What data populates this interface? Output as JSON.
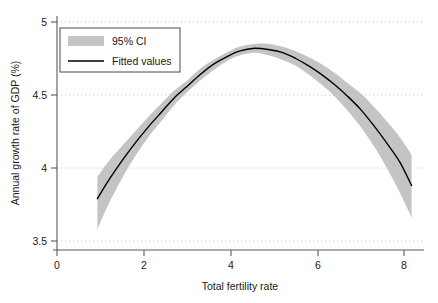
{
  "chart_data": {
    "type": "line",
    "title": "",
    "subtitle": "",
    "xlabel": "Total fertility rate",
    "ylabel": "Annual growth rate of GDP (%)",
    "xlim": [
      0,
      8.6
    ],
    "ylim": [
      3.37,
      5.0
    ],
    "xticks": [
      0,
      2,
      4,
      6,
      8
    ],
    "xticklabels": [
      "0",
      "2",
      "4",
      "6",
      "8"
    ],
    "yticks": [
      3.5,
      4,
      4.5,
      5
    ],
    "yticklabels": [
      "3.5",
      "4",
      "4.5",
      "5"
    ],
    "grid": "horizontal-dotted",
    "legend_position": "top-left",
    "legend": [
      {
        "key": "ci_band",
        "label": "95% CI",
        "marker": "filled-rect",
        "color": "#c4c4c4"
      },
      {
        "key": "fitted",
        "label": "Fitted values",
        "marker": "line",
        "color": "#000000"
      }
    ],
    "series": [
      {
        "name": "Fitted values",
        "type": "line",
        "color": "#000000",
        "x": [
          0.93,
          1.2,
          1.5,
          1.8,
          2.1,
          2.4,
          2.7,
          3.0,
          3.3,
          3.6,
          3.9,
          4.2,
          4.55,
          4.9,
          5.2,
          5.5,
          5.8,
          6.1,
          6.4,
          6.7,
          7.0,
          7.3,
          7.6,
          7.9,
          8.17
        ],
        "values": [
          3.79,
          3.92,
          4.05,
          4.17,
          4.28,
          4.38,
          4.48,
          4.56,
          4.64,
          4.71,
          4.76,
          4.8,
          4.82,
          4.81,
          4.79,
          4.75,
          4.7,
          4.64,
          4.57,
          4.49,
          4.4,
          4.29,
          4.17,
          4.04,
          3.88
        ]
      },
      {
        "name": "95% CI upper",
        "type": "band-upper",
        "color": "#c4c4c4",
        "x": [
          0.93,
          1.2,
          1.5,
          1.8,
          2.1,
          2.4,
          2.7,
          3.0,
          3.3,
          3.6,
          3.9,
          4.2,
          4.55,
          4.9,
          5.2,
          5.5,
          5.8,
          6.1,
          6.4,
          6.7,
          7.0,
          7.3,
          7.6,
          7.9,
          8.17
        ],
        "values": [
          3.94,
          4.05,
          4.15,
          4.25,
          4.35,
          4.44,
          4.53,
          4.6,
          4.68,
          4.74,
          4.79,
          4.83,
          4.85,
          4.85,
          4.83,
          4.8,
          4.76,
          4.71,
          4.65,
          4.58,
          4.51,
          4.42,
          4.32,
          4.21,
          4.09
        ]
      },
      {
        "name": "95% CI lower",
        "type": "band-lower",
        "color": "#c4c4c4",
        "x": [
          0.93,
          1.2,
          1.5,
          1.8,
          2.1,
          2.4,
          2.7,
          3.0,
          3.3,
          3.6,
          3.9,
          4.2,
          4.55,
          4.9,
          5.2,
          5.5,
          5.8,
          6.1,
          6.4,
          6.7,
          7.0,
          7.3,
          7.6,
          7.9,
          8.17
        ],
        "values": [
          3.58,
          3.76,
          3.93,
          4.08,
          4.21,
          4.32,
          4.43,
          4.52,
          4.6,
          4.67,
          4.73,
          4.77,
          4.79,
          4.77,
          4.74,
          4.7,
          4.64,
          4.57,
          4.49,
          4.39,
          4.28,
          4.15,
          4.0,
          3.83,
          3.66
        ]
      }
    ]
  },
  "style": {
    "band_color": "#c4c4c4",
    "line_color": "#000000",
    "grid_color": "#b9b9cc",
    "axis_color": "#5a5a5a",
    "text_color": "#1a1a1a",
    "background": "#ffffff"
  }
}
